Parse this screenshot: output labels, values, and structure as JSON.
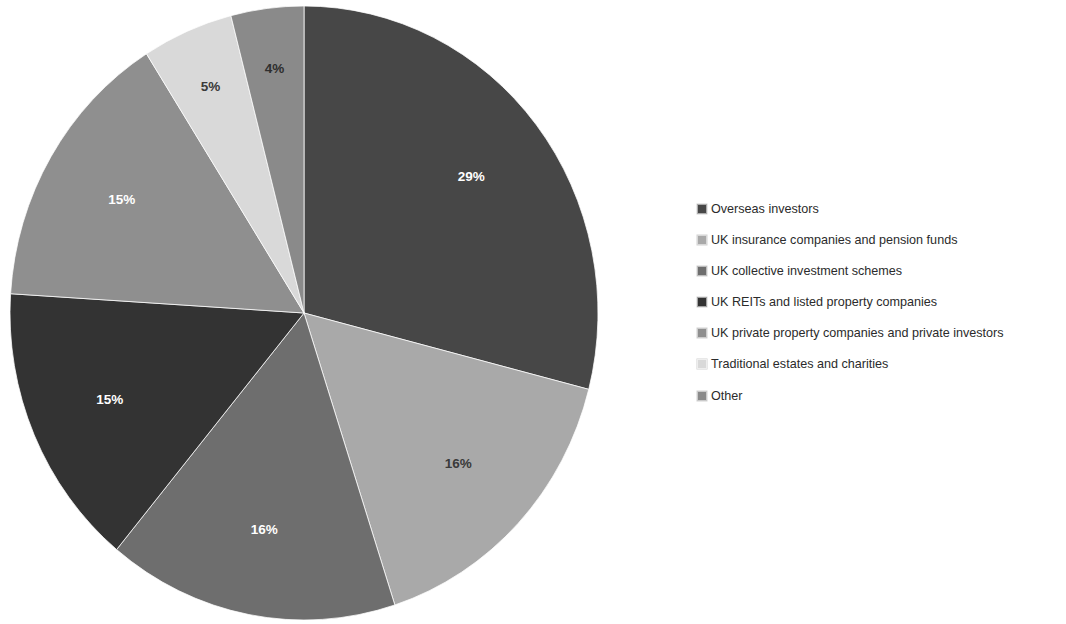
{
  "chart_data": {
    "type": "pie",
    "title": "",
    "subtitle": "",
    "xlabel": "",
    "ylabel": "",
    "grid": false,
    "legend_position": "right",
    "start_angle_deg": 0,
    "direction": "clockwise",
    "units": "percent",
    "total": 100,
    "categories": [
      "Overseas investors",
      "UK insurance companies and pension funds",
      "UK collective investment schemes",
      "UK REITs and listed property companies",
      "UK private property companies and private investors",
      "Traditional estates and charities",
      "Other"
    ],
    "values": [
      29,
      16,
      16,
      15,
      15,
      5,
      4
    ],
    "data_labels": [
      "29%",
      "16%",
      "16%",
      "15%",
      "15%",
      "5%",
      "4%"
    ],
    "colors": [
      "#474747",
      "#a9a9a9",
      "#6e6e6e",
      "#333333",
      "#8f8f8f",
      "#d9d9d9",
      "#8a8a8a"
    ],
    "label_text_colors": [
      "#ffffff",
      "#3a3a3a",
      "#ffffff",
      "#ffffff",
      "#ffffff",
      "#3a3a3a",
      "#2e2e2e"
    ],
    "slices": [
      {
        "label": "Overseas investors",
        "value": 29,
        "display": "29%",
        "color": "#474747",
        "label_color": "#ffffff"
      },
      {
        "label": "UK insurance companies and pension funds",
        "value": 16,
        "display": "16%",
        "color": "#a9a9a9",
        "label_color": "#3a3a3a"
      },
      {
        "label": "UK collective investment schemes",
        "value": 16,
        "display": "16%",
        "color": "#6e6e6e",
        "label_color": "#ffffff"
      },
      {
        "label": "UK REITs and listed property companies",
        "value": 15,
        "display": "15%",
        "color": "#333333",
        "label_color": "#ffffff"
      },
      {
        "label": "UK private property companies and private investors",
        "value": 15,
        "display": "15%",
        "color": "#8f8f8f",
        "label_color": "#ffffff"
      },
      {
        "label": "Traditional estates and charities",
        "value": 5,
        "display": "5%",
        "color": "#d9d9d9",
        "label_color": "#3a3a3a"
      },
      {
        "label": "Other",
        "value": 4,
        "display": "4%",
        "color": "#8a8a8a",
        "label_color": "#2e2e2e"
      }
    ]
  },
  "legend": {
    "items": [
      {
        "label": "Overseas investors",
        "color": "#474747"
      },
      {
        "label": "UK insurance companies and pension funds",
        "color": "#a9a9a9"
      },
      {
        "label": "UK collective investment schemes",
        "color": "#6e6e6e"
      },
      {
        "label": "UK REITs and listed property companies",
        "color": "#333333"
      },
      {
        "label": "UK private property companies and private investors",
        "color": "#8f8f8f"
      },
      {
        "label": "Traditional estates and charities",
        "color": "#d9d9d9"
      },
      {
        "label": "Other",
        "color": "#8a8a8a"
      }
    ]
  },
  "geometry": {
    "center_x": 304,
    "center_y": 313,
    "radius_x": 294,
    "radius_y": 307,
    "label_radius_factor": 0.72
  }
}
